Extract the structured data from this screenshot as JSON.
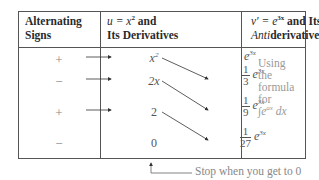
{
  "table": {
    "headers": {
      "signs": [
        "Alternating",
        "Signs"
      ],
      "u": {
        "line1_prefix": "u = x",
        "line1_sup": "2",
        "line1_suffix": " and",
        "line2": "Its Derivatives"
      },
      "v": {
        "line1_prefix": "v′ = e",
        "line1_sup": "3x",
        "line1_suffix": " and Its",
        "line2_italic": "Anti",
        "line2_rest": "derivatives"
      }
    },
    "rows": [
      {
        "sign": "+",
        "u_base": "x",
        "u_sup": "2",
        "v_num": "",
        "v_den": "",
        "v_base": "e",
        "v_sup": "3x"
      },
      {
        "sign": "−",
        "u_base": "2x",
        "u_sup": "",
        "v_num": "1",
        "v_den": "3",
        "v_base": "e",
        "v_sup": "3x"
      },
      {
        "sign": "+",
        "u_base": "2",
        "u_sup": "",
        "v_num": "1",
        "v_den": "9",
        "v_base": "e",
        "v_sup": "3x"
      },
      {
        "sign": "−",
        "u_base": "0",
        "u_sup": "",
        "v_num": "1",
        "v_den": "27",
        "v_base": "e",
        "v_sup": "3x"
      }
    ],
    "note": {
      "lines": [
        "Using",
        "the",
        "formula",
        "for"
      ],
      "integral": "∫",
      "int_base": "e",
      "int_sup": "ax",
      "int_dx": "dx"
    }
  },
  "footer": {
    "text": "Stop when you get to 0"
  }
}
